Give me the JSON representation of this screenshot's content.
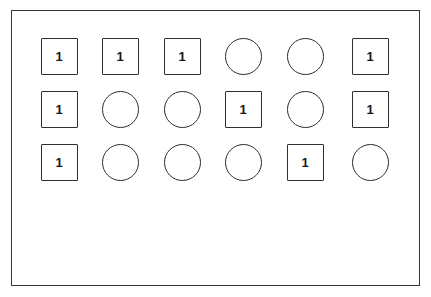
{
  "figure": {
    "background_color": "#ffffff",
    "stroke_color": "#2d2e32",
    "frame_stroke_color": "#35363a",
    "label_color": "#17181b",
    "columns": 6,
    "rows": 3,
    "shape_size_px": 37,
    "column_centers_px": [
      59,
      120,
      182,
      243,
      305,
      370
    ],
    "row_centers_px": [
      56,
      109,
      162
    ],
    "frame": {
      "x": 11,
      "y": 10,
      "width": 409,
      "height": 276
    },
    "grid": [
      {
        "row_index": 0,
        "cells": [
          {
            "shape": "square",
            "label": "1"
          },
          {
            "shape": "square",
            "label": "1"
          },
          {
            "shape": "square",
            "label": "1"
          },
          {
            "shape": "circle",
            "label": ""
          },
          {
            "shape": "circle",
            "label": ""
          },
          {
            "shape": "square",
            "label": "1"
          }
        ]
      },
      {
        "row_index": 1,
        "cells": [
          {
            "shape": "square",
            "label": "1"
          },
          {
            "shape": "circle",
            "label": ""
          },
          {
            "shape": "circle",
            "label": ""
          },
          {
            "shape": "square",
            "label": "1"
          },
          {
            "shape": "circle",
            "label": ""
          },
          {
            "shape": "square",
            "label": "1"
          }
        ]
      },
      {
        "row_index": 2,
        "cells": [
          {
            "shape": "square",
            "label": "1"
          },
          {
            "shape": "circle",
            "label": ""
          },
          {
            "shape": "circle",
            "label": ""
          },
          {
            "shape": "circle",
            "label": ""
          },
          {
            "shape": "square",
            "label": "1"
          },
          {
            "shape": "circle",
            "label": ""
          }
        ]
      }
    ]
  }
}
